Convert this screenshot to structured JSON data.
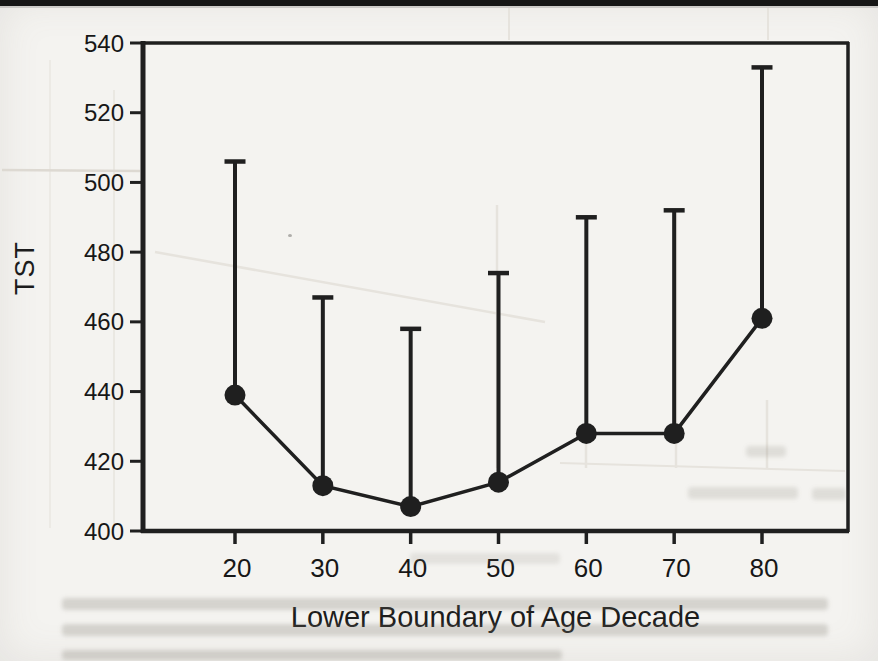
{
  "figure": {
    "kind": "scanned book figure",
    "paper_color": "#f4f3f0",
    "ink_color": "#1f1f1f",
    "top_rule_color": "#161616"
  },
  "chart_data": {
    "type": "line",
    "title": "",
    "xlabel": "Lower Boundary of Age Decade",
    "ylabel": "TST",
    "categories": [
      20,
      30,
      40,
      50,
      60,
      70,
      80
    ],
    "series": [
      {
        "name": "Mean TST by age decade",
        "values": [
          439,
          413,
          407,
          414,
          428,
          428,
          461
        ],
        "error_upper": [
          506,
          467,
          458,
          474,
          490,
          492,
          533
        ]
      }
    ],
    "xlim": [
      9.5,
      90
    ],
    "ylim": [
      400,
      540
    ],
    "xticks": [
      20,
      30,
      40,
      50,
      60,
      70,
      80
    ],
    "yticks": [
      400,
      420,
      440,
      460,
      480,
      500,
      520,
      540
    ],
    "grid": "off",
    "legend": "none",
    "marker": "filled-circle",
    "error_bars": "upper-only-with-caps"
  }
}
